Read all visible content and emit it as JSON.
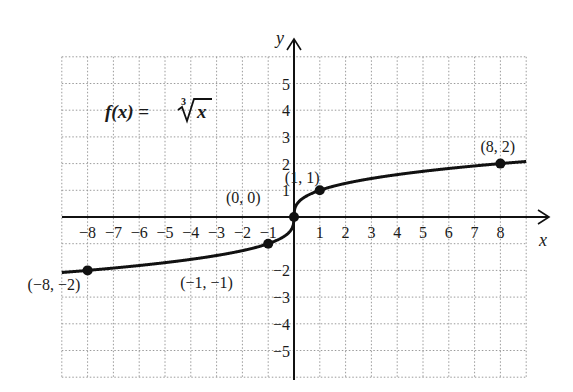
{
  "chart_data": {
    "type": "line",
    "function_label": {
      "lhs": "f(x) = ",
      "root_index": "3",
      "radicand": "x"
    },
    "xlabel": "x",
    "ylabel": "y",
    "xlim": [
      -9,
      9
    ],
    "ylim": [
      -6,
      6
    ],
    "grid": true,
    "grid_style": "dotted",
    "x_ticks": [
      "-8",
      "-7",
      "-6",
      "-5",
      "-4",
      "-3",
      "-2",
      "-1",
      "1",
      "2",
      "3",
      "4",
      "5",
      "6",
      "7",
      "8"
    ],
    "y_ticks": [
      "5",
      "4",
      "3",
      "2",
      "1",
      "-2",
      "-3",
      "-4",
      "-5"
    ],
    "series": [
      {
        "name": "f(x) = cube root of x",
        "x": [
          -9,
          -8,
          -1,
          0,
          1,
          8,
          9
        ],
        "y": [
          -2.08,
          -2,
          -1,
          0,
          1,
          2,
          2.08
        ]
      }
    ],
    "labeled_points": [
      {
        "x": -8,
        "y": -2,
        "label": "(−8, −2)"
      },
      {
        "x": -1,
        "y": -1,
        "label": "(−1, −1)"
      },
      {
        "x": 0,
        "y": 0,
        "label": "(0, 0)"
      },
      {
        "x": 1,
        "y": 1,
        "label": "(1, 1)"
      },
      {
        "x": 8,
        "y": 2,
        "label": "(8, 2)"
      }
    ]
  },
  "colors": {
    "curve": "#111111",
    "grid": "#9a9a9a",
    "axis": "#111111",
    "background": "#ffffff"
  }
}
